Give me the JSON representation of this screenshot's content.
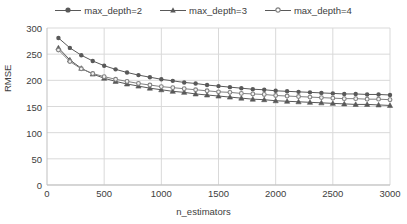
{
  "chart_data": {
    "type": "line",
    "title": "",
    "xlabel": "n_estimators",
    "ylabel": "RMSE",
    "xlim": [
      0,
      3000
    ],
    "ylim": [
      0,
      300
    ],
    "xticks": [
      0,
      500,
      1000,
      1500,
      2000,
      2500,
      3000
    ],
    "yticks": [
      0,
      50,
      100,
      150,
      200,
      250,
      300
    ],
    "grid": "horizontal-and-vertical",
    "legend_position": "top-center",
    "x": [
      100,
      200,
      300,
      400,
      500,
      600,
      700,
      800,
      900,
      1000,
      1100,
      1200,
      1300,
      1400,
      1500,
      1600,
      1700,
      1800,
      1900,
      2000,
      2100,
      2200,
      2300,
      2400,
      2500,
      2600,
      2700,
      2800,
      2900,
      3000
    ],
    "series": [
      {
        "name": "max_depth=2",
        "marker": "filled-circle",
        "color": "#595959",
        "values": [
          281,
          262,
          248,
          237,
          228,
          221,
          215,
          210,
          206,
          202,
          199,
          196,
          194,
          191,
          189,
          187,
          185,
          183,
          182,
          180,
          179,
          178,
          177,
          176,
          175,
          174,
          174,
          173,
          173,
          172
        ]
      },
      {
        "name": "max_depth=3",
        "marker": "filled-triangle",
        "color": "#595959",
        "values": [
          262,
          239,
          223,
          212,
          204,
          198,
          193,
          189,
          185,
          182,
          179,
          177,
          174,
          172,
          170,
          168,
          166,
          164,
          163,
          161,
          160,
          159,
          158,
          157,
          156,
          155,
          154,
          154,
          153,
          152
        ]
      },
      {
        "name": "max_depth=4",
        "marker": "open-circle",
        "color": "#808080",
        "values": [
          258,
          236,
          222,
          213,
          207,
          202,
          198,
          194,
          191,
          188,
          186,
          184,
          182,
          180,
          178,
          177,
          175,
          174,
          173,
          171,
          170,
          169,
          168,
          167,
          166,
          165,
          165,
          164,
          164,
          163
        ]
      }
    ]
  },
  "legend": {
    "items": [
      {
        "label": "max_depth=2"
      },
      {
        "label": "max_depth=3"
      },
      {
        "label": "max_depth=4"
      }
    ]
  }
}
